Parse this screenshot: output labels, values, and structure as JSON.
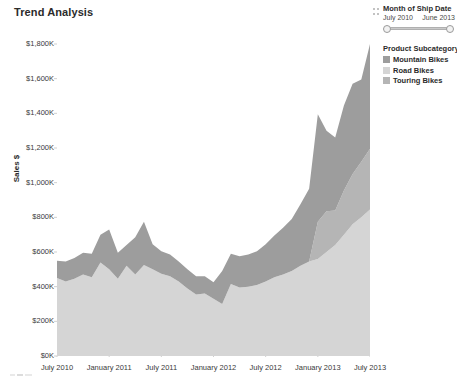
{
  "title": "Trend Analysis",
  "filter": {
    "name": "Month of Ship Date",
    "start": "July 2010",
    "end": "June 2013",
    "grip_icon": "drag-grip-icon"
  },
  "legend": {
    "title": "Product Subcategory",
    "items": [
      {
        "label": "Mountain Bikes",
        "color": "#9d9d9d",
        "swatch_icon": "color-swatch-icon"
      },
      {
        "label": "Road Bikes",
        "color": "#d5d5d5",
        "swatch_icon": "color-swatch-icon"
      },
      {
        "label": "Touring Bikes",
        "color": "#b5b5b5",
        "swatch_icon": "color-swatch-icon"
      }
    ]
  },
  "chart_data": {
    "type": "area",
    "stacked": true,
    "title": "Trend Analysis",
    "xlabel": "Month of Ship Date",
    "ylabel": "Sales $",
    "ylim": [
      0,
      1800000
    ],
    "ytick_labels": [
      "$1,800K",
      "$1,600K",
      "$1,400K",
      "$1,200K",
      "$1,000K",
      "$800K",
      "$600K",
      "$400K",
      "$200K",
      "$0K"
    ],
    "ytick_values": [
      1800000,
      1600000,
      1400000,
      1200000,
      1000000,
      800000,
      600000,
      400000,
      200000,
      0
    ],
    "xtick_labels": [
      "July 2010",
      "January 2011",
      "July 2011",
      "January 2012",
      "July 2012",
      "January 2013",
      "July 2013"
    ],
    "grid": false,
    "legend_position": "right",
    "x": [
      "July 2010",
      "August 2010",
      "September 2010",
      "October 2010",
      "November 2010",
      "December 2010",
      "January 2011",
      "February 2011",
      "March 2011",
      "April 2011",
      "May 2011",
      "June 2011",
      "July 2011",
      "August 2011",
      "September 2011",
      "October 2011",
      "November 2011",
      "December 2011",
      "January 2012",
      "February 2012",
      "March 2012",
      "April 2012",
      "May 2012",
      "June 2012",
      "July 2012",
      "August 2012",
      "September 2012",
      "October 2012",
      "November 2012",
      "December 2012",
      "January 2013",
      "February 2013",
      "March 2013",
      "April 2013",
      "May 2013",
      "June 2013",
      "July 2013"
    ],
    "series": [
      {
        "name": "Road Bikes",
        "color": "#d5d5d5",
        "values": [
          450000,
          430000,
          445000,
          470000,
          455000,
          540000,
          500000,
          445000,
          520000,
          470000,
          525000,
          500000,
          475000,
          460000,
          430000,
          390000,
          355000,
          360000,
          330000,
          300000,
          415000,
          395000,
          400000,
          410000,
          430000,
          455000,
          470000,
          490000,
          520000,
          545000,
          560000,
          600000,
          640000,
          700000,
          760000,
          800000,
          845000
        ]
      },
      {
        "name": "Touring Bikes",
        "color": "#b5b5b5",
        "values": [
          0,
          0,
          0,
          0,
          0,
          0,
          0,
          0,
          0,
          0,
          0,
          0,
          0,
          0,
          0,
          0,
          0,
          0,
          0,
          0,
          0,
          0,
          0,
          0,
          0,
          0,
          0,
          0,
          0,
          0,
          215000,
          235000,
          200000,
          255000,
          290000,
          320000,
          350000
        ]
      },
      {
        "name": "Mountain Bikes",
        "color": "#9d9d9d",
        "values": [
          100000,
          115000,
          120000,
          125000,
          135000,
          160000,
          230000,
          150000,
          120000,
          215000,
          250000,
          145000,
          130000,
          125000,
          115000,
          110000,
          105000,
          100000,
          95000,
          190000,
          175000,
          180000,
          185000,
          195000,
          215000,
          240000,
          270000,
          300000,
          355000,
          420000,
          620000,
          465000,
          420000,
          490000,
          520000,
          475000,
          605000
        ]
      }
    ]
  }
}
